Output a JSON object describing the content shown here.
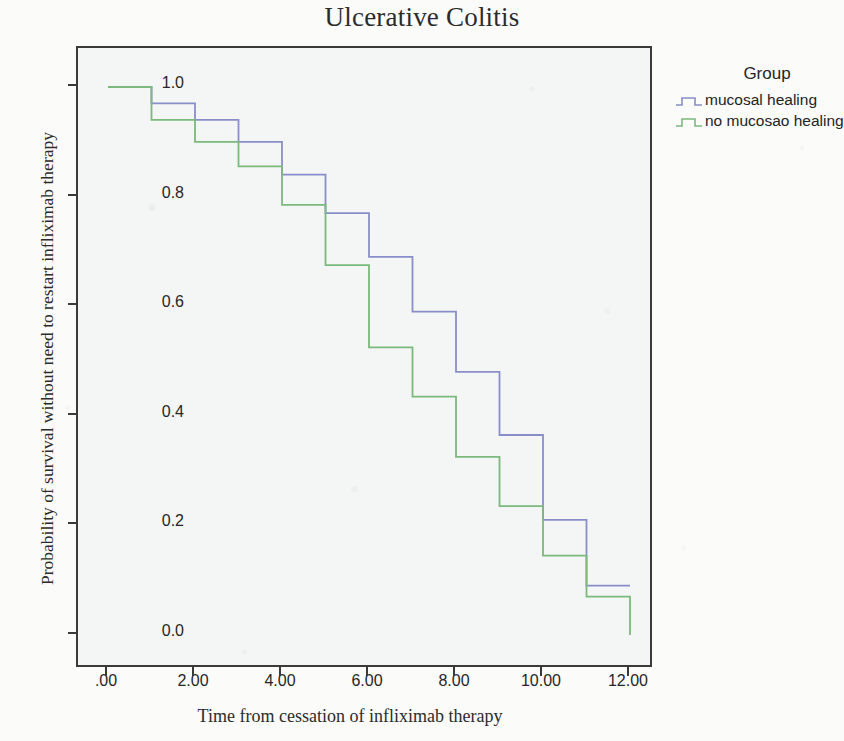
{
  "title": "Ulcerative Colitis",
  "legend": {
    "title": "Group",
    "items": [
      {
        "label": "mucosal healing",
        "color": "#8a8ec8"
      },
      {
        "label": "no mucosao healing",
        "color": "#7cb97c"
      }
    ]
  },
  "axes": {
    "xlabel": "Time from cessation of infliximab therapy",
    "ylabel": "Probability of survival without need to restart infliximab therapy",
    "xticks": [
      ".00",
      "2.00",
      "4.00",
      "6.00",
      "8.00",
      "10.00",
      "12.00"
    ],
    "yticks": [
      "1.0",
      "0.8",
      "0.6",
      "0.4",
      "0.2",
      "0.0"
    ]
  },
  "chart_data": {
    "type": "line",
    "subtype": "kaplan-meier-step",
    "title": "Ulcerative Colitis",
    "xlabel": "Time from cessation of infliximab therapy",
    "ylabel": "Probability of survival without need to restart infliximab therapy",
    "xlim": [
      0,
      12
    ],
    "ylim": [
      0.0,
      1.0
    ],
    "xticks": [
      0,
      2,
      4,
      6,
      8,
      10,
      12
    ],
    "yticks": [
      0.0,
      0.2,
      0.4,
      0.6,
      0.8,
      1.0
    ],
    "grid": false,
    "legend_position": "right",
    "legend_title": "Group",
    "series": [
      {
        "name": "mucosal healing",
        "color": "#8a8ec8",
        "x": [
          0,
          1,
          2,
          3,
          4,
          5,
          6,
          7,
          8,
          9,
          10,
          11,
          12
        ],
        "y": [
          1.0,
          0.97,
          0.94,
          0.9,
          0.84,
          0.77,
          0.69,
          0.59,
          0.48,
          0.365,
          0.21,
          0.09,
          0.09
        ]
      },
      {
        "name": "no mucosao healing",
        "color": "#7cb97c",
        "x": [
          0,
          1,
          2,
          3,
          4,
          5,
          6,
          7,
          8,
          9,
          10,
          11,
          12
        ],
        "y": [
          1.0,
          0.94,
          0.9,
          0.855,
          0.785,
          0.675,
          0.525,
          0.435,
          0.325,
          0.235,
          0.145,
          0.07,
          0.0
        ]
      }
    ]
  }
}
